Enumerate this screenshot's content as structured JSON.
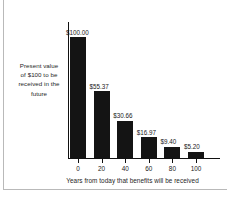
{
  "chart_data": {
    "type": "bar",
    "title": "",
    "xlabel": "Years from today that benefits will be received",
    "ylabel": "Present value of $100 to be received in the future",
    "categories": [
      "0",
      "20",
      "40",
      "60",
      "80",
      "100"
    ],
    "values": [
      100.0,
      55.37,
      30.66,
      16.97,
      9.4,
      5.2
    ],
    "data_labels": [
      "$100.00",
      "$55.37",
      "$30.66",
      "$16.97",
      "$9.40",
      "$5.20"
    ],
    "ylim": [
      0,
      100
    ],
    "xlim": [
      -10,
      110
    ],
    "grid": false,
    "legend": null,
    "bar_color": "#141414",
    "axis_color": "#111111",
    "background": "#ffffff"
  },
  "axis": {
    "y_label_lines": [
      "Present value",
      "of $100 to be",
      "received in the",
      "future"
    ],
    "x_title": "Years from today that benefits will be received",
    "x_ticks": [
      "0",
      "20",
      "40",
      "60",
      "80",
      "100"
    ]
  },
  "bars": [
    {
      "label": "$100.00",
      "category": "0",
      "value": 100.0
    },
    {
      "label": "$55.37",
      "category": "20",
      "value": 55.37
    },
    {
      "label": "$30.66",
      "category": "40",
      "value": 30.66
    },
    {
      "label": "$16.97",
      "category": "60",
      "value": 16.97
    },
    {
      "label": "$9.40",
      "category": "80",
      "value": 9.4
    },
    {
      "label": "$5.20",
      "category": "100",
      "value": 5.2
    }
  ]
}
